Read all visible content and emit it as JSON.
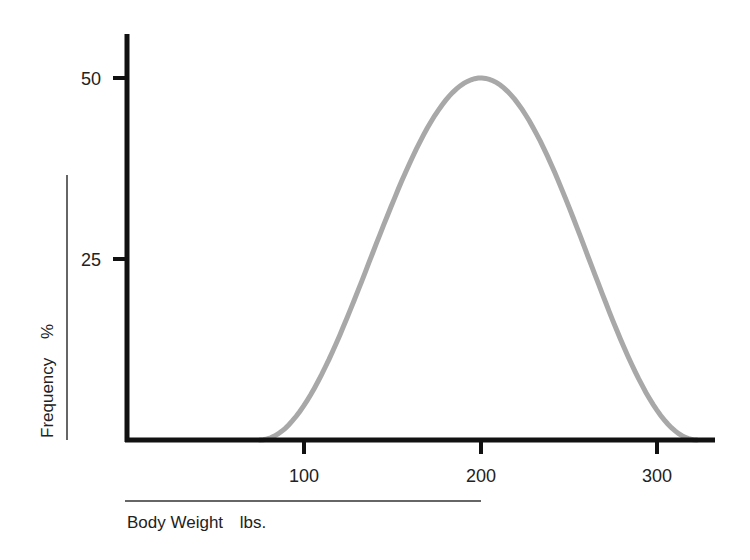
{
  "chart_data": {
    "type": "line",
    "title": "",
    "xlabel": "Body Weight",
    "xlabel_unit": "lbs.",
    "ylabel": "Frequency",
    "ylabel_unit": "%",
    "xlim": [
      0,
      330
    ],
    "ylim": [
      0,
      55
    ],
    "x_ticks": [
      100,
      200,
      300
    ],
    "y_ticks": [
      25,
      50
    ],
    "grid": false,
    "legend": null,
    "series": [
      {
        "name": "Body weight distribution",
        "color": "#a8a8a8",
        "x": [
          75,
          87.5,
          100,
          112.5,
          125,
          137.5,
          150,
          162.5,
          175,
          187.5,
          200,
          212.5,
          225,
          237.5,
          250,
          262.5,
          275,
          287.5,
          300,
          312.5,
          322
        ],
        "y": [
          0,
          0.6,
          2.4,
          5.3,
          9.0,
          13.5,
          18.5,
          23.9,
          29.3,
          34.8,
          40.2,
          45.0,
          48.6,
          50.0,
          48.9,
          45.5,
          39.6,
          31.2,
          20.5,
          9.0,
          0
        ]
      }
    ]
  },
  "labels": {
    "x_title": "Body Weight",
    "x_unit": "lbs.",
    "y_title": "Frequency",
    "y_unit": "%",
    "x_tick_100": "100",
    "x_tick_200": "200",
    "x_tick_300": "300",
    "y_tick_25": "25",
    "y_tick_50": "50"
  }
}
